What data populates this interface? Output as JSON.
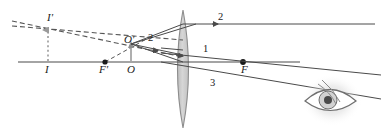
{
  "figure": {
    "type": "optics-ray-diagram",
    "background_color": "#ffffff",
    "line_color": "#3a3a3a",
    "lens_fill": "#c9c9c9",
    "lens_stroke": "#8a8a8a",
    "dashed_color": "#555555",
    "dotted_color": "#9a9a9a",
    "width": 381,
    "height": 133
  },
  "labels": {
    "image_tip": "I'",
    "image_base": "I",
    "object_tip": "O'",
    "object_base": "O",
    "focal_left": "F'",
    "focal_right": "F",
    "ray_one": "1",
    "ray_two": "2",
    "ray_three": "3"
  },
  "geometry": {
    "axis": {
      "y": 62,
      "x_start": 18,
      "x_end": 300
    },
    "lens": {
      "center_x": 183,
      "top_y": 10,
      "bottom_y": 128,
      "half_width": 11
    },
    "object": {
      "base_x": 131,
      "base_y": 62,
      "tip_x": 131,
      "tip_y": 42
    },
    "image": {
      "base_x": 48,
      "base_y": 62,
      "tip_x": 48,
      "tip_y": 24
    },
    "focal_left_point": {
      "x": 105,
      "y": 62
    },
    "focal_right_point": {
      "x": 243,
      "y": 62
    },
    "ray_two_y": 24,
    "eye": {
      "x": 330,
      "y": 100
    }
  },
  "elements": {
    "axis_name": "principal-axis",
    "lens_name": "converging-lens",
    "eye_name": "observer-eye"
  }
}
